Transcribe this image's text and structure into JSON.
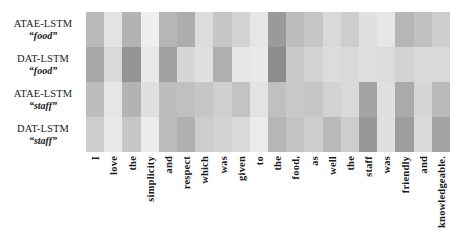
{
  "figure": {
    "kind": "attention-heatmap",
    "background_color": "#ffffff"
  },
  "rows": [
    {
      "model": "ATAE-LSTM",
      "aspect": "“food”"
    },
    {
      "model": "DAT-LSTM",
      "aspect": "“food”"
    },
    {
      "model": "ATAE-LSTM",
      "aspect": "“staff”"
    },
    {
      "model": "DAT-LSTM",
      "aspect": "“staff”"
    }
  ],
  "chart_data": {
    "type": "heatmap",
    "title": "",
    "xlabel": "",
    "ylabel": "",
    "grid": false,
    "legend_position": "none",
    "colormap": "greys",
    "value_range": [
      0.0,
      1.0
    ],
    "x": [
      "I",
      "love",
      "the",
      "simplicity",
      "and",
      "respect",
      "which",
      "was",
      "given",
      "to",
      "the",
      "food,",
      "as",
      "well",
      "the",
      "staff",
      "was",
      "friendly",
      "and",
      "knowledgeable."
    ],
    "y": [
      "ATAE-LSTM “food”",
      "DAT-LSTM “food”",
      "ATAE-LSTM “staff”",
      "DAT-LSTM “staff”"
    ],
    "series": [
      {
        "name": "ATAE-LSTM “food”",
        "values": [
          0.42,
          0.16,
          0.46,
          0.08,
          0.44,
          0.5,
          0.2,
          0.34,
          0.26,
          0.14,
          0.62,
          0.4,
          0.34,
          0.22,
          0.3,
          0.18,
          0.14,
          0.44,
          0.38,
          0.3
        ]
      },
      {
        "name": "DAT-LSTM “food”",
        "values": [
          0.54,
          0.22,
          0.66,
          0.12,
          0.58,
          0.24,
          0.18,
          0.48,
          0.14,
          0.12,
          0.7,
          0.32,
          0.26,
          0.2,
          0.22,
          0.18,
          0.2,
          0.26,
          0.22,
          0.22
        ]
      },
      {
        "name": "ATAE-LSTM “staff”",
        "values": [
          0.4,
          0.14,
          0.46,
          0.18,
          0.4,
          0.38,
          0.34,
          0.28,
          0.36,
          0.16,
          0.38,
          0.32,
          0.34,
          0.26,
          0.22,
          0.56,
          0.18,
          0.52,
          0.24,
          0.42
        ]
      },
      {
        "name": "DAT-LSTM “staff”",
        "values": [
          0.3,
          0.12,
          0.34,
          0.1,
          0.4,
          0.48,
          0.3,
          0.26,
          0.22,
          0.1,
          0.44,
          0.36,
          0.3,
          0.42,
          0.3,
          0.64,
          0.18,
          0.6,
          0.22,
          0.56
        ]
      }
    ]
  }
}
